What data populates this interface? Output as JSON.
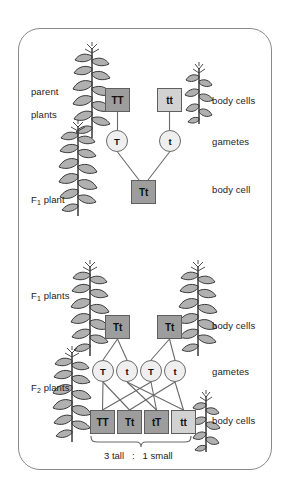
{
  "diagram": {
    "title_caption": "3 tall  :  1 small",
    "left_labels": [
      {
        "id": "parent-plants",
        "text": "parent\nplants",
        "x": 20,
        "y": 74
      },
      {
        "id": "f1-plant",
        "text": "F₁ plant",
        "x": 20,
        "y": 182
      },
      {
        "id": "f1-plants",
        "text": "F₁ plants",
        "x": 20,
        "y": 278
      },
      {
        "id": "f2-plants",
        "text": "F₂ plants",
        "x": 20,
        "y": 370
      }
    ],
    "right_labels": [
      {
        "id": "body-cells-parent",
        "text": "body cells",
        "x": 212,
        "y": 95
      },
      {
        "id": "gametes-f1",
        "text": "gametes",
        "x": 212,
        "y": 136
      },
      {
        "id": "body-cell-f1",
        "text": "body cell",
        "x": 212,
        "y": 184
      },
      {
        "id": "body-cells-f1",
        "text": "body cells",
        "x": 212,
        "y": 320
      },
      {
        "id": "gametes-f2",
        "text": "gametes",
        "x": 212,
        "y": 366
      },
      {
        "id": "body-cells-f2",
        "text": "body cells",
        "x": 212,
        "y": 415
      }
    ],
    "cross1": {
      "parent_boxes": [
        {
          "id": "parent-genotype-TT",
          "label": "TT",
          "shade": "dark",
          "x": 105,
          "y": 88
        },
        {
          "id": "parent-genotype-tt",
          "label": "tt",
          "shade": "light",
          "x": 157,
          "y": 88
        }
      ],
      "gametes": [
        {
          "id": "gamete-T",
          "label": "T",
          "x": 106,
          "y": 130
        },
        {
          "id": "gamete-t",
          "label": "t",
          "x": 159,
          "y": 130
        }
      ],
      "offspring_boxes": [
        {
          "id": "f1-genotype-Tt",
          "label": "Tt",
          "shade": "dark",
          "x": 131,
          "y": 180
        }
      ]
    },
    "cross2": {
      "parent_boxes": [
        {
          "id": "f1-genotype-Tt-left",
          "label": "Tt",
          "shade": "dark",
          "x": 105,
          "y": 315
        },
        {
          "id": "f1-genotype-Tt-right",
          "label": "Tt",
          "shade": "dark",
          "x": 157,
          "y": 315
        }
      ],
      "gametes": [
        {
          "id": "gamete-T-1",
          "label": "T",
          "x": 92,
          "y": 360
        },
        {
          "id": "gamete-t-1",
          "label": "t",
          "x": 116,
          "y": 360
        },
        {
          "id": "gamete-T-2",
          "label": "T",
          "x": 140,
          "y": 360
        },
        {
          "id": "gamete-t-2",
          "label": "t",
          "x": 164,
          "y": 360
        }
      ],
      "offspring_boxes": [
        {
          "id": "f2-genotype-TT",
          "label": "TT",
          "shade": "dark",
          "x": 90,
          "y": 410
        },
        {
          "id": "f2-genotype-Tt",
          "label": "Tt",
          "shade": "dark",
          "x": 117,
          "y": 410
        },
        {
          "id": "f2-genotype-tT",
          "label": "tT",
          "shade": "dark",
          "x": 144,
          "y": 410
        },
        {
          "id": "f2-genotype-tt",
          "label": "tt",
          "shade": "light",
          "x": 171,
          "y": 410
        }
      ],
      "ratio_caption": {
        "text": "3 tall   :   1 small",
        "x": 104,
        "y": 447
      }
    },
    "plants": [
      {
        "id": "plant-parent-tall",
        "kind": "tall",
        "x": 72,
        "y": 42,
        "h": 72
      },
      {
        "id": "plant-parent-small",
        "kind": "small",
        "x": 185,
        "y": 64,
        "h": 46
      },
      {
        "id": "plant-f1-tall",
        "kind": "tall",
        "x": 60,
        "y": 122,
        "h": 76
      },
      {
        "id": "plant-f1-tall-left",
        "kind": "tall",
        "x": 72,
        "y": 262,
        "h": 74
      },
      {
        "id": "plant-f1-tall-right",
        "kind": "tall",
        "x": 180,
        "y": 262,
        "h": 74
      },
      {
        "id": "plant-f2-tall",
        "kind": "tall",
        "x": 55,
        "y": 348,
        "h": 76
      },
      {
        "id": "plant-f2-small",
        "kind": "small",
        "x": 192,
        "y": 392,
        "h": 44
      }
    ],
    "colors": {
      "box_dark": "#9d9d9d",
      "box_light": "#d2d2d2",
      "circle_fill": "#efefef",
      "stroke": "#6a6a6a",
      "frame": "#8a8a8a",
      "text": "#1d1d1d"
    }
  }
}
